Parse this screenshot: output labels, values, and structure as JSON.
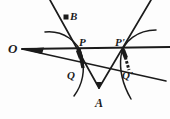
{
  "figure": {
    "kind": "geometry-diagram",
    "background_color": "#fdfdfd",
    "ink_color": "#1b1b1b",
    "width": 170,
    "height": 119,
    "labels": {
      "O": "O",
      "B": "B",
      "P": "P",
      "P_prime": "P'",
      "Q": "Q",
      "Q_prime": "Q'",
      "A": "A"
    },
    "points": {
      "O": {
        "x": 22,
        "y": 49
      },
      "B": {
        "x": 66,
        "y": 17
      },
      "P": {
        "x": 80,
        "y": 47
      },
      "P_prime": {
        "x": 124,
        "y": 47
      },
      "Q": {
        "x": 76,
        "y": 68
      },
      "Q_prime": {
        "x": 131,
        "y": 68
      },
      "A": {
        "x": 99,
        "y": 88
      }
    },
    "marked_dot": "B",
    "rays_from_O": [
      {
        "name": "upper-ray",
        "from": "O",
        "through": "P",
        "to": {
          "x": 170,
          "y": 47
        }
      },
      {
        "name": "lower-ray",
        "from": "O",
        "through": "Q",
        "to": {
          "x": 166,
          "y": 81
        }
      }
    ],
    "segments": [
      {
        "name": "line-B-through-P-to-A",
        "from": {
          "x": 50,
          "y": 0
        },
        "to": {
          "x": 99,
          "y": 88
        }
      },
      {
        "name": "line-A-to-P-prime-extended",
        "from": {
          "x": 99,
          "y": 88
        },
        "to": {
          "x": 150,
          "y": 0
        }
      }
    ],
    "arcs": [
      {
        "name": "left-arc",
        "center_side": "left",
        "through": [
          "P",
          "Q"
        ]
      },
      {
        "name": "right-arc",
        "center_side": "right",
        "through": [
          "P_prime",
          "Q_prime"
        ]
      }
    ],
    "tick_marks": [
      {
        "name": "tick-P-Q",
        "between": [
          "P",
          "Q"
        ]
      },
      {
        "name": "tick-P-prime-Q-prime",
        "between": [
          "P_prime",
          "Q_prime"
        ]
      }
    ]
  }
}
